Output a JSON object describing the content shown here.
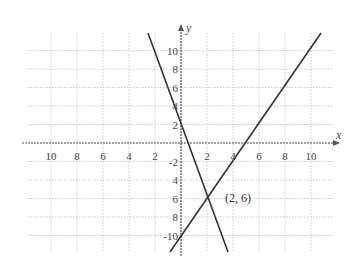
{
  "chart_data": {
    "type": "line",
    "title": "",
    "xlabel": "x",
    "ylabel": "y",
    "xlim": [
      -12,
      12
    ],
    "ylim": [
      -12,
      12
    ],
    "grid": true,
    "x_ticks": [
      "10",
      "8",
      "6",
      "4",
      "2",
      "2",
      "4",
      "6",
      "8",
      "10"
    ],
    "y_ticks": [
      "10",
      "8",
      "6",
      "4",
      "2",
      "-2",
      "4",
      "6",
      "8",
      "-10"
    ],
    "x_tick_values": [
      -10,
      -8,
      -6,
      -4,
      -2,
      2,
      4,
      6,
      8,
      10
    ],
    "y_tick_values": [
      10,
      8,
      6,
      4,
      2,
      -2,
      -4,
      -6,
      -8,
      -10
    ],
    "series": [
      {
        "name": "line1",
        "equation": "y = -5x + 4",
        "points": [
          [
            -1.6,
            12
          ],
          [
            0,
            4
          ],
          [
            2,
            -6
          ],
          [
            3.2,
            -12
          ]
        ]
      },
      {
        "name": "line2",
        "equation": "y = 2x - 10",
        "points": [
          [
            -0.8,
            -11.6
          ],
          [
            0,
            -10
          ],
          [
            2,
            -6
          ],
          [
            5,
            0
          ],
          [
            10.8,
            11.6
          ]
        ]
      }
    ],
    "annotations": [
      {
        "text": "(2,  6)",
        "x": 2,
        "y": -6
      }
    ]
  },
  "labels": {
    "x_axis": "x",
    "y_axis": "y",
    "intersection": "(2,   6)"
  }
}
